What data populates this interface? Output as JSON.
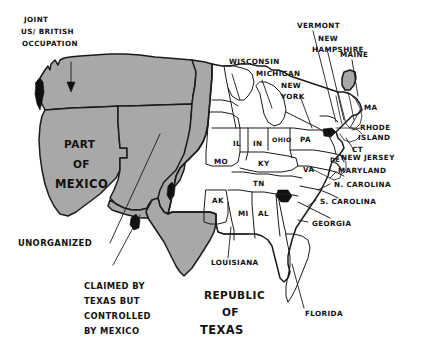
{
  "figure": {
    "kind": "hand-drawn-historical-map",
    "background_color": "#ffffff",
    "ink_color": "#1a1a1a",
    "shaded_fill_color": "#a8a8a8",
    "black_fill_color": "#101010"
  },
  "annotations": [
    {
      "id": "joint-occupation",
      "lines": [
        "JOINT",
        "US/ BRITISH",
        "OCCUPATION"
      ],
      "has_arrow": true,
      "size": "small"
    },
    {
      "id": "part-of-mexico",
      "lines": [
        "PART",
        "OF",
        "MEXICO"
      ],
      "has_arrow": false,
      "size": "big"
    },
    {
      "id": "unorganized",
      "lines": [
        "UNORGANIZED"
      ],
      "has_arrow": false,
      "size": "med"
    },
    {
      "id": "claimed-by-texas",
      "lines": [
        "CLAIMED BY",
        "TEXAS BUT",
        "CONTROLLED",
        "BY MEXICO"
      ],
      "has_arrow": false,
      "size": "med"
    },
    {
      "id": "republic-of-texas",
      "lines": [
        "REPUBLIC",
        "OF",
        "TEXAS"
      ],
      "has_arrow": false,
      "size": "big"
    }
  ],
  "state_labels": [
    {
      "id": "wisconsin",
      "text": "WISCONSIN",
      "size": "small",
      "leader": true
    },
    {
      "id": "michigan",
      "text": "MICHIGAN",
      "size": "small",
      "leader": true
    },
    {
      "id": "new-york",
      "text": "NEW",
      "size": "small",
      "leader": true
    },
    {
      "id": "new-york-2",
      "text": "YORK",
      "size": "small",
      "leader": false
    },
    {
      "id": "vermont",
      "text": "VERMONT",
      "size": "small",
      "leader": true
    },
    {
      "id": "new-hampshire",
      "text": "NEW",
      "size": "small",
      "leader": true
    },
    {
      "id": "new-hampshire-2",
      "text": "HAMPSHIRE",
      "size": "small",
      "leader": false
    },
    {
      "id": "maine",
      "text": "MAINE",
      "size": "small",
      "leader": true
    },
    {
      "id": "massachusetts",
      "text": "MA",
      "size": "small",
      "leader": true
    },
    {
      "id": "rhode-island",
      "text": "RHODE",
      "size": "small",
      "leader": true
    },
    {
      "id": "rhode-island-2",
      "text": "ISLAND",
      "size": "small",
      "leader": false
    },
    {
      "id": "connecticut",
      "text": "CT",
      "size": "small",
      "leader": true
    },
    {
      "id": "delaware",
      "text": "DE",
      "size": "tiny",
      "leader": true
    },
    {
      "id": "new-jersey",
      "text": "NEW JERSEY",
      "size": "small",
      "leader": true
    },
    {
      "id": "maryland",
      "text": "MARYLAND",
      "size": "small",
      "leader": true
    },
    {
      "id": "north-carolina",
      "text": "N. CAROLINA",
      "size": "small",
      "leader": true
    },
    {
      "id": "south-carolina",
      "text": "S. CAROLINA",
      "size": "small",
      "leader": true
    },
    {
      "id": "georgia",
      "text": "GEORGIA",
      "size": "small",
      "leader": true
    },
    {
      "id": "florida",
      "text": "FLORIDA",
      "size": "small",
      "leader": true
    },
    {
      "id": "louisiana",
      "text": "LOUISIANA",
      "size": "small",
      "leader": true
    },
    {
      "id": "pennsylvania",
      "text": "PA",
      "size": "small",
      "leader": false
    },
    {
      "id": "virginia",
      "text": "VA",
      "size": "small",
      "leader": false
    },
    {
      "id": "ohio",
      "text": "OHIO",
      "size": "tiny",
      "leader": false
    },
    {
      "id": "indiana",
      "text": "IN",
      "size": "small",
      "leader": false
    },
    {
      "id": "illinois",
      "text": "IL",
      "size": "small",
      "leader": false
    },
    {
      "id": "missouri",
      "text": "MO",
      "size": "small",
      "leader": false
    },
    {
      "id": "kentucky",
      "text": "KY",
      "size": "small",
      "leader": false
    },
    {
      "id": "tennessee",
      "text": "TN",
      "size": "small",
      "leader": false
    },
    {
      "id": "arkansas",
      "text": "AK",
      "size": "small",
      "leader": false
    },
    {
      "id": "mississippi",
      "text": "MI",
      "size": "small",
      "leader": false
    },
    {
      "id": "alabama",
      "text": "AL",
      "size": "small",
      "leader": false
    }
  ]
}
